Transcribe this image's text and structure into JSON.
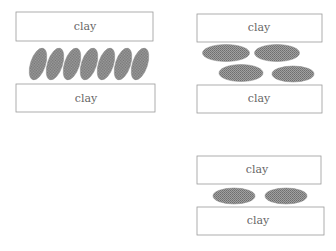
{
  "diagram": {
    "type": "clay-particle-arrangement",
    "label_color": "#666666",
    "particle_fill": "#8c8c8c",
    "panels": [
      {
        "id": "left",
        "top_clay_label": "clay",
        "bottom_clay_label": "clay",
        "particle_arrangement": "tilted, tightly packed single row",
        "particle_count": 7
      },
      {
        "id": "right-top",
        "top_clay_label": "clay",
        "bottom_clay_label": "clay",
        "particle_arrangement": "flat, two staggered rows",
        "particle_count": 4
      },
      {
        "id": "right-bottom",
        "top_clay_label": "clay",
        "bottom_clay_label": "clay",
        "particle_arrangement": "flat, single row",
        "particle_count": 2
      }
    ]
  }
}
